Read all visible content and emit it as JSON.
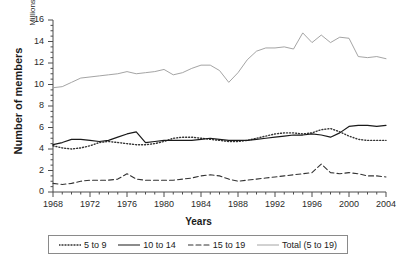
{
  "chart_data": {
    "type": "line",
    "title": "",
    "xlabel": "Years",
    "ylabel": "Number of members",
    "yunit": "Millions",
    "ylim": [
      0,
      16
    ],
    "ytick_labels": [
      "0",
      "2",
      "4",
      "6",
      "8",
      "10",
      "12",
      "14",
      "16"
    ],
    "xlim": [
      1968,
      2004
    ],
    "xtick_labels": [
      "1968",
      "1972",
      "1976",
      "1980",
      "1984",
      "1988",
      "1992",
      "1996",
      "2000",
      "2004"
    ],
    "grid": false,
    "legend_position": "bottom",
    "x": [
      1968,
      1969,
      1970,
      1971,
      1972,
      1973,
      1974,
      1975,
      1976,
      1977,
      1978,
      1979,
      1980,
      1981,
      1982,
      1983,
      1984,
      1985,
      1986,
      1987,
      1988,
      1989,
      1990,
      1991,
      1992,
      1993,
      1994,
      1995,
      1996,
      1997,
      1998,
      1999,
      2000,
      2001,
      2002,
      2003,
      2004
    ],
    "series": [
      {
        "name": "5 to 9",
        "style": "dotted",
        "color": "#333333",
        "values": [
          4.3,
          4.1,
          4.0,
          4.1,
          4.3,
          4.6,
          4.7,
          4.6,
          4.5,
          4.4,
          4.4,
          4.5,
          4.7,
          5.0,
          5.1,
          5.1,
          5.0,
          4.9,
          4.8,
          4.7,
          4.7,
          4.8,
          5.0,
          5.2,
          5.4,
          5.5,
          5.5,
          5.4,
          5.5,
          5.8,
          5.9,
          5.6,
          5.2,
          4.9,
          4.8,
          4.8,
          4.8
        ]
      },
      {
        "name": "10 to 14",
        "style": "solid",
        "color": "#1a1a1a",
        "values": [
          4.4,
          4.6,
          4.9,
          4.9,
          4.8,
          4.7,
          4.8,
          5.1,
          5.4,
          5.6,
          4.6,
          4.7,
          4.8,
          4.8,
          4.8,
          4.8,
          4.9,
          5.0,
          4.9,
          4.8,
          4.8,
          4.8,
          4.9,
          5.0,
          5.1,
          5.2,
          5.3,
          5.3,
          5.4,
          5.3,
          5.1,
          5.5,
          6.1,
          6.2,
          6.2,
          6.1,
          6.2
        ]
      },
      {
        "name": "15 to 19",
        "style": "dashed",
        "color": "#333333",
        "values": [
          0.8,
          0.7,
          0.8,
          1.0,
          1.1,
          1.1,
          1.1,
          1.2,
          1.7,
          1.2,
          1.1,
          1.1,
          1.1,
          1.1,
          1.2,
          1.3,
          1.5,
          1.6,
          1.5,
          1.2,
          1.0,
          1.1,
          1.2,
          1.3,
          1.4,
          1.5,
          1.6,
          1.7,
          1.8,
          2.6,
          1.8,
          1.7,
          1.8,
          1.7,
          1.5,
          1.5,
          1.4
        ]
      },
      {
        "name": "Total (5 to 19)",
        "style": "solid-thin",
        "color": "#9a9a9a",
        "values": [
          9.7,
          9.8,
          10.2,
          10.6,
          10.7,
          10.8,
          10.9,
          11.0,
          11.2,
          11.0,
          11.1,
          11.2,
          11.4,
          10.9,
          11.1,
          11.5,
          11.8,
          11.8,
          11.3,
          10.2,
          11.1,
          12.3,
          13.1,
          13.4,
          13.4,
          13.5,
          13.3,
          14.8,
          13.9,
          14.6,
          13.9,
          14.4,
          14.3,
          12.6,
          12.5,
          12.6,
          12.4
        ]
      }
    ]
  },
  "axis": {
    "y_title": "Number of members",
    "y_unit": "Millions",
    "x_title": "Years"
  },
  "legend": {
    "items": [
      {
        "label": "5 to 9"
      },
      {
        "label": "10 to 14"
      },
      {
        "label": "15 to 19"
      },
      {
        "label": "Total (5 to 19)"
      }
    ]
  }
}
